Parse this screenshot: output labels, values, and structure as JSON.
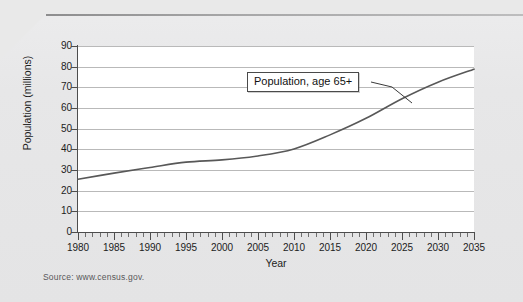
{
  "chart_data": {
    "type": "line",
    "title": "",
    "xlabel": "Year",
    "ylabel": "Population (millions)",
    "xlim": [
      1980,
      2035
    ],
    "ylim": [
      0,
      90
    ],
    "grid": true,
    "legend_position": "none",
    "annotation": "Population, age 65+",
    "source": "Source: www.census.gov.",
    "ytick_labels": [
      "90",
      "80",
      "70",
      "60",
      "50",
      "40",
      "30",
      "20",
      "10",
      "0"
    ],
    "ytick_values": [
      90,
      80,
      70,
      60,
      50,
      40,
      30,
      20,
      10,
      0
    ],
    "xtick_labels": [
      "1980",
      "1985",
      "1990",
      "1995",
      "2000",
      "2005",
      "2010",
      "2015",
      "2020",
      "2025",
      "2030",
      "2035"
    ],
    "xtick_values": [
      1980,
      1985,
      1990,
      1995,
      2000,
      2005,
      2010,
      2015,
      2020,
      2025,
      2030,
      2035
    ],
    "series": [
      {
        "name": "Population, age 65+",
        "color": "#585858",
        "x": [
          1980,
          1985,
          1990,
          1995,
          2000,
          2005,
          2010,
          2015,
          2020,
          2025,
          2030,
          2035
        ],
        "values": [
          25.5,
          28.5,
          31.2,
          33.8,
          34.9,
          36.8,
          40.2,
          47.0,
          55.0,
          64.5,
          72.5,
          78.8
        ]
      }
    ]
  },
  "annotation_box": {
    "label": "Population, age 65+"
  },
  "axes": {
    "y_title": "Population (millions)",
    "x_title": "Year"
  },
  "footer": {
    "source": "Source: www.census.gov."
  }
}
